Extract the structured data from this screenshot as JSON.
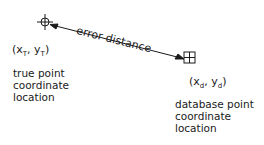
{
  "diagram": {
    "edge_label": "error distance",
    "true_point": {
      "coord_x": "x",
      "coord_x_sub": "T",
      "coord_y": "y",
      "coord_y_sub": "T",
      "description_lines": [
        "true point",
        "coordinate",
        "location"
      ]
    },
    "database_point": {
      "coord_x": "x",
      "coord_x_sub": "d",
      "coord_y": "y",
      "coord_y_sub": "d",
      "description_lines": [
        "database point",
        "coordinate",
        "location"
      ]
    },
    "colors": {
      "ink": "#1a1a1a",
      "background": "#ffffff"
    }
  }
}
